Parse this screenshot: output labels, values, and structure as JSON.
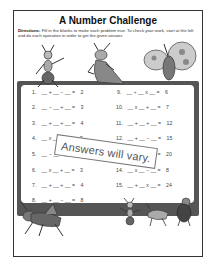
{
  "worksheet": {
    "title": "A Number Challenge",
    "directions_label": "Directions:",
    "directions_text": "Fill in the blanks to make each problem true. To check your work, start at the left and do each operation in order to get the given answer.",
    "stamp_text": "Answers will vary.",
    "left_problems": [
      {
        "num": "1.",
        "expr": "__ + __ − __ =",
        "answer": "2"
      },
      {
        "num": "2.",
        "expr": "__ − __ + __ =",
        "answer": "3"
      },
      {
        "num": "3.",
        "expr": "__ + __ + __ =",
        "answer": "4"
      },
      {
        "num": "4.",
        "expr": "__ x __ ÷ __ =",
        "answer": "5"
      },
      {
        "num": "5.",
        "expr": "__ − __ x __ =",
        "answer": "6"
      },
      {
        "num": "6.",
        "expr": "__ x __ + __ =",
        "answer": "3"
      },
      {
        "num": "7.",
        "expr": "__ + __ + __ =",
        "answer": "4"
      },
      {
        "num": "8.",
        "expr": "__ + __ − __ =",
        "answer": "8"
      }
    ],
    "right_problems": [
      {
        "num": "9.",
        "expr": "__ ÷ __ x __ =",
        "answer": "6"
      },
      {
        "num": "10.",
        "expr": "__ x __ + __ =",
        "answer": "7"
      },
      {
        "num": "11.",
        "expr": "__ + __ + __ =",
        "answer": "12"
      },
      {
        "num": "12.",
        "expr": "__ + __ − __ =",
        "answer": "15"
      },
      {
        "num": "13.",
        "expr": "__ + __ x __ =",
        "answer": "20"
      },
      {
        "num": "14.",
        "expr": "__ x __ − __ =",
        "answer": "8"
      },
      {
        "num": "15.",
        "expr": "__ + __ x __ =",
        "answer": "24"
      }
    ]
  },
  "illustrations": [
    "ant-icon",
    "mantis-icon",
    "butterfly-icon",
    "grasshopper-icon",
    "ant-small-icon",
    "cricket-icon",
    "beetle-icon"
  ],
  "colors": {
    "frame": "#555555",
    "border": "#333333",
    "text": "#444444"
  }
}
